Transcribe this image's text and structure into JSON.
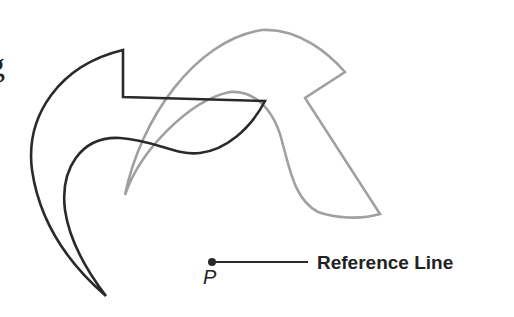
{
  "fragment_text": "g",
  "reference_line_label": "Reference Line",
  "point_label": "P",
  "colors": {
    "original_shape": "#2a2a2a",
    "transformed_shape": "#a0a0a0",
    "text": "#222222"
  }
}
